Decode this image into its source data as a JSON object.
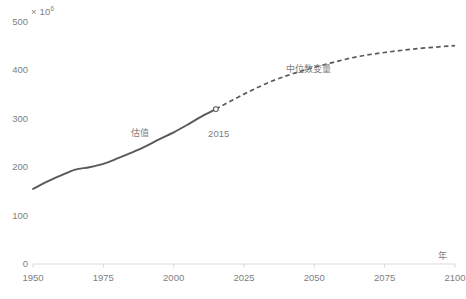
{
  "chart_data": {
    "type": "line",
    "title": "",
    "xlabel": "年",
    "ylabel": "",
    "y_multiplier": "× 10",
    "y_multiplier_exponent": "6",
    "xlim": [
      1950,
      2100
    ],
    "ylim": [
      0,
      500
    ],
    "grid": false,
    "legend_position": "inline-annotation",
    "x_ticks": [
      "1950",
      "1975",
      "2000",
      "2025",
      "2050",
      "2075",
      "2100"
    ],
    "x_tick_values": [
      1950,
      1975,
      2000,
      2025,
      2050,
      2075,
      2100
    ],
    "y_ticks": [
      "0",
      "100",
      "200",
      "300",
      "400",
      "500"
    ],
    "y_tick_values": [
      0,
      100,
      200,
      300,
      400,
      500
    ],
    "series": [
      {
        "name": "估值",
        "style": "solid",
        "color": "#595959",
        "annotation": "估值",
        "annotation_x": 1988,
        "annotation_y": 268,
        "x": [
          1950,
          1955,
          1960,
          1965,
          1970,
          1975,
          1980,
          1985,
          1990,
          1995,
          2000,
          2005,
          2010,
          2015
        ],
        "values": [
          155,
          170,
          183,
          195,
          200,
          207,
          218,
          230,
          243,
          258,
          272,
          288,
          305,
          320
        ]
      },
      {
        "name": "中位数变量",
        "style": "dashed",
        "color": "#595959",
        "annotation": "中位数变量",
        "annotation_x": 2048,
        "annotation_y": 400,
        "x": [
          2015,
          2025,
          2035,
          2045,
          2055,
          2065,
          2075,
          2085,
          2095,
          2100
        ],
        "values": [
          320,
          351,
          378,
          398,
          414,
          428,
          437,
          444,
          449,
          451
        ]
      }
    ],
    "markers": [
      {
        "label": "2015",
        "x": 2015,
        "y": 320,
        "shape": "open-circle",
        "color": "#595959"
      }
    ],
    "annotations": [
      {
        "text": "估值",
        "x": 1988,
        "y": 268
      },
      {
        "text": "中位数变量",
        "x": 2048,
        "y": 400
      },
      {
        "text": "2015",
        "x": 2016,
        "y": 268
      }
    ],
    "axis_color": "#d9d9d9"
  }
}
